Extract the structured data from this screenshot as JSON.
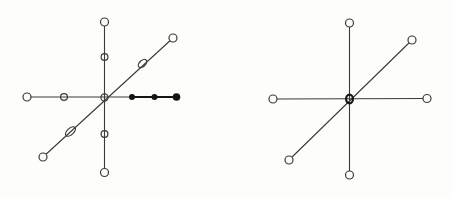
{
  "canvas": {
    "width": 453,
    "height": 198,
    "background": "#fdfdfb",
    "ink": "#3a3a3a",
    "bold_ink": "#151515"
  },
  "figures": [
    {
      "name": "left-star-figure",
      "lines": [
        {
          "x1": 27,
          "y1": 97,
          "x2": 132,
          "y2": 97,
          "w": 1.1,
          "bold": false
        },
        {
          "x1": 132,
          "y1": 97,
          "x2": 177.5,
          "y2": 97,
          "w": 1.9,
          "bold": true
        },
        {
          "x1": 104.5,
          "y1": 22,
          "x2": 104.5,
          "y2": 173,
          "w": 1.1,
          "bold": false
        },
        {
          "x1": 43,
          "y1": 157,
          "x2": 173,
          "y2": 38,
          "w": 1.1,
          "bold": false
        }
      ],
      "markers": [
        {
          "type": "open",
          "x": 27,
          "y": 97,
          "r": 4,
          "fill": "bg"
        },
        {
          "type": "open",
          "x": 64,
          "y": 97,
          "r": 3.4,
          "fill": "none"
        },
        {
          "type": "open",
          "x": 104.5,
          "y": 97.5,
          "r": 3.6,
          "fill": "none"
        },
        {
          "type": "dot",
          "x": 132,
          "y": 97,
          "r": 3,
          "fill": "ink"
        },
        {
          "type": "dot",
          "x": 154.5,
          "y": 97,
          "r": 3,
          "fill": "ink"
        },
        {
          "type": "dot",
          "x": 176.5,
          "y": 97,
          "r": 3.8,
          "fill": "ink"
        },
        {
          "type": "open",
          "x": 104.5,
          "y": 22,
          "r": 4,
          "fill": "bg"
        },
        {
          "type": "open",
          "x": 104.5,
          "y": 57,
          "r": 3.4,
          "fill": "none"
        },
        {
          "type": "open",
          "x": 104.5,
          "y": 134,
          "r": 3.4,
          "fill": "none"
        },
        {
          "type": "open",
          "x": 104.5,
          "y": 172.5,
          "r": 4,
          "fill": "bg"
        },
        {
          "type": "open",
          "x": 43,
          "y": 157,
          "r": 4,
          "fill": "bg"
        },
        {
          "type": "ellipse",
          "x": 70.5,
          "y": 131.5,
          "rx": 6,
          "ry": 3.2,
          "angle": -42.5,
          "fill": "none"
        },
        {
          "type": "ellipse",
          "x": 142.5,
          "y": 63.5,
          "rx": 5,
          "ry": 3,
          "angle": -42.5,
          "fill": "none"
        },
        {
          "type": "open",
          "x": 173,
          "y": 38,
          "r": 4,
          "fill": "bg"
        }
      ]
    },
    {
      "name": "right-star-figure",
      "lines": [
        {
          "x1": 273,
          "y1": 99,
          "x2": 427,
          "y2": 98.5,
          "w": 1.1,
          "bold": false
        },
        {
          "x1": 349.5,
          "y1": 23,
          "x2": 349.5,
          "y2": 175,
          "w": 1.1,
          "bold": false
        },
        {
          "x1": 289,
          "y1": 160,
          "x2": 412,
          "y2": 40,
          "w": 1.1,
          "bold": false
        }
      ],
      "markers": [
        {
          "type": "open",
          "x": 273,
          "y": 99,
          "r": 4,
          "fill": "bg"
        },
        {
          "type": "open",
          "x": 427,
          "y": 98.5,
          "r": 4,
          "fill": "bg"
        },
        {
          "type": "open",
          "x": 349.5,
          "y": 23,
          "r": 4,
          "fill": "bg"
        },
        {
          "type": "open",
          "x": 349.5,
          "y": 175,
          "r": 4,
          "fill": "bg"
        },
        {
          "type": "open",
          "x": 289,
          "y": 160,
          "r": 4,
          "fill": "bg"
        },
        {
          "type": "open",
          "x": 412,
          "y": 40,
          "r": 4,
          "fill": "bg"
        },
        {
          "type": "center",
          "x": 349.5,
          "y": 99,
          "rx": 3.4,
          "ry": 4.4,
          "w": 2.2,
          "fill": "none"
        }
      ]
    }
  ]
}
